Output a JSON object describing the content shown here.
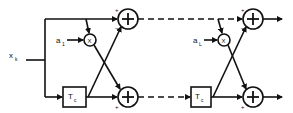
{
  "diagram": {
    "input": {
      "symbol": "x",
      "subscript": "k"
    },
    "stages": [
      {
        "coefficient": {
          "symbol": "a",
          "subscript": "1"
        },
        "delay": {
          "symbol": "T",
          "subscript": "c"
        }
      },
      {
        "coefficient": {
          "symbol": "a",
          "subscript": "L"
        },
        "delay": {
          "symbol": "T",
          "subscript": "c"
        }
      }
    ],
    "summer_signs": {
      "top_plus": "+",
      "top_minus": "−",
      "bottom_minus": "−",
      "bottom_plus": "+"
    },
    "multiplier_symbol": "X"
  }
}
